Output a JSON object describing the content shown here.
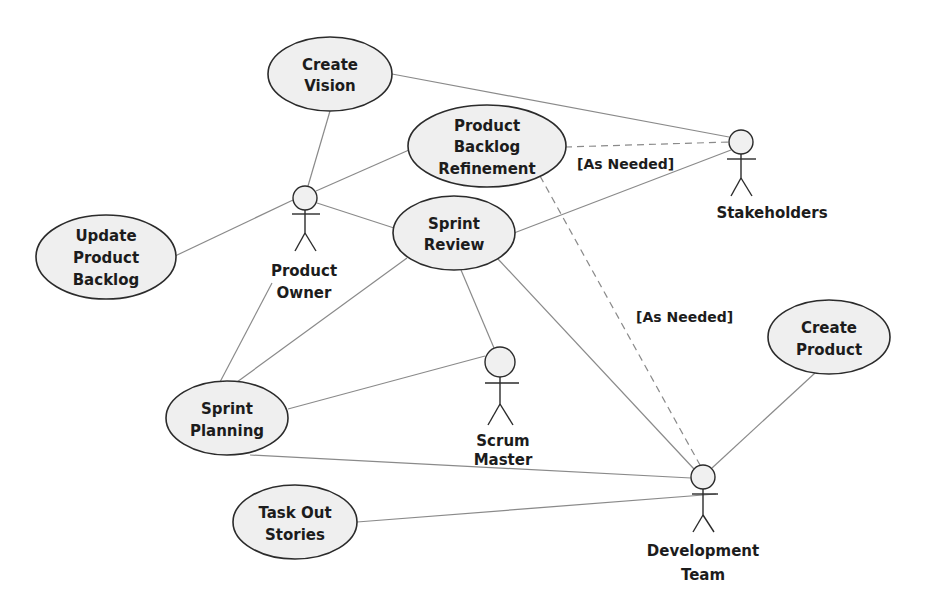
{
  "diagram": {
    "type": "UML use case diagram",
    "colors": {
      "ellipse_fill": "#efefef",
      "outline": "#2b2b2b",
      "association": "#8a8a8a"
    },
    "use_cases": [
      {
        "id": "create_vision",
        "lines": [
          "Create",
          "Vision"
        ]
      },
      {
        "id": "pbr",
        "lines": [
          "Product",
          "Backlog",
          "Refinement"
        ]
      },
      {
        "id": "update_pb",
        "lines": [
          "Update",
          "Product",
          "Backlog"
        ]
      },
      {
        "id": "sprint_review",
        "lines": [
          "Sprint",
          "Review"
        ]
      },
      {
        "id": "sprint_planning",
        "lines": [
          "Sprint",
          "Planning"
        ]
      },
      {
        "id": "task_out",
        "lines": [
          "Task Out",
          "Stories"
        ]
      },
      {
        "id": "create_product",
        "lines": [
          "Create",
          "Product"
        ]
      }
    ],
    "actors": [
      {
        "id": "product_owner",
        "lines": [
          "Product",
          "Owner"
        ]
      },
      {
        "id": "stakeholders",
        "lines": [
          "Stakeholders"
        ]
      },
      {
        "id": "scrum_master",
        "lines": [
          "Scrum",
          "Master"
        ]
      },
      {
        "id": "dev_team",
        "lines": [
          "Development",
          "Team"
        ]
      }
    ],
    "guards": [
      {
        "id": "guard_stakeholders",
        "text": "[As Needed]"
      },
      {
        "id": "guard_devteam",
        "text": "[As Needed]"
      }
    ],
    "associations": [
      {
        "from": "create_vision",
        "to": "product_owner",
        "style": "solid"
      },
      {
        "from": "create_vision",
        "to": "stakeholders",
        "style": "solid"
      },
      {
        "from": "pbr",
        "to": "product_owner",
        "style": "solid"
      },
      {
        "from": "pbr",
        "to": "stakeholders",
        "style": "dashed",
        "label": "[As Needed]"
      },
      {
        "from": "pbr",
        "to": "dev_team",
        "style": "dashed",
        "label": "[As Needed]"
      },
      {
        "from": "update_pb",
        "to": "product_owner",
        "style": "solid"
      },
      {
        "from": "sprint_review",
        "to": "product_owner",
        "style": "solid"
      },
      {
        "from": "sprint_review",
        "to": "stakeholders",
        "style": "solid"
      },
      {
        "from": "sprint_review",
        "to": "scrum_master",
        "style": "solid"
      },
      {
        "from": "sprint_review",
        "to": "dev_team",
        "style": "solid"
      },
      {
        "from": "sprint_review",
        "to": "sprint_planning",
        "style": "solid"
      },
      {
        "from": "sprint_planning",
        "to": "product_owner",
        "style": "solid"
      },
      {
        "from": "sprint_planning",
        "to": "scrum_master",
        "style": "solid"
      },
      {
        "from": "sprint_planning",
        "to": "dev_team",
        "style": "solid"
      },
      {
        "from": "task_out",
        "to": "dev_team",
        "style": "solid"
      },
      {
        "from": "create_product",
        "to": "dev_team",
        "style": "solid"
      }
    ]
  }
}
